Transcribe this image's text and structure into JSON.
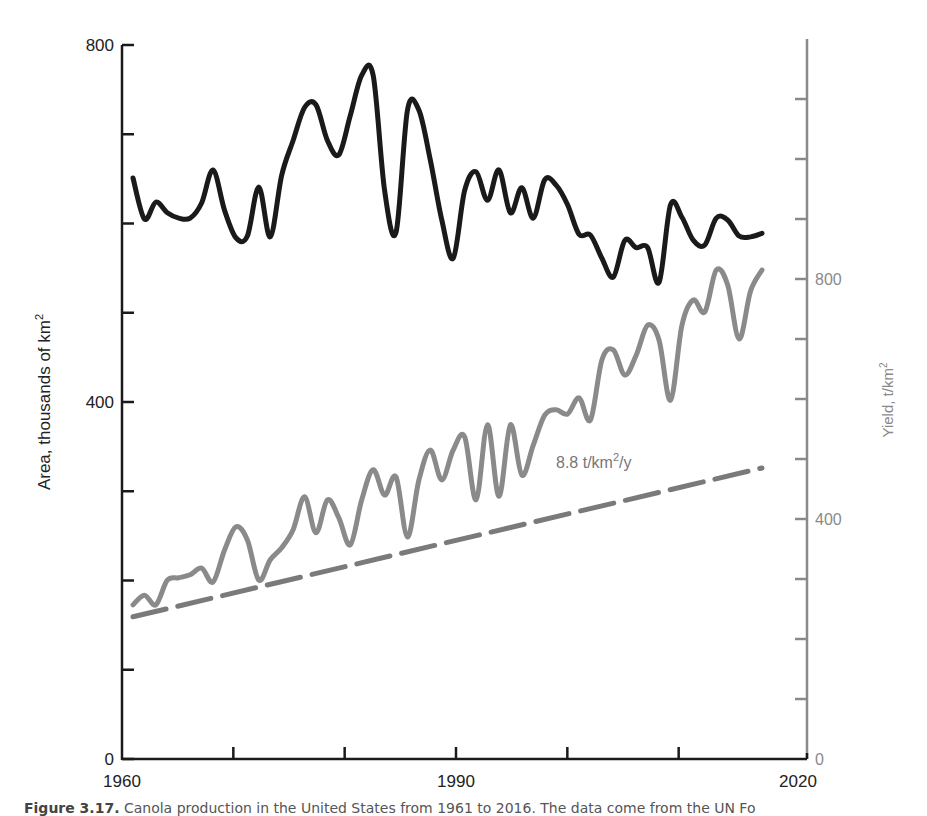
{
  "figure": {
    "caption_label": "Figure 3.17.",
    "caption_text": "Canola production in the United States from 1961 to 2016. The data come from the UN Fo"
  },
  "chart_data": {
    "type": "line",
    "title": "",
    "xlabel": "",
    "x_ticks": [
      1960,
      1970,
      1980,
      1990,
      2000,
      2010,
      2020
    ],
    "x_tick_labels": [
      "1960",
      "1990",
      "2020"
    ],
    "xlim": [
      1960,
      2020
    ],
    "y_left": {
      "label": "Area, thousands of km",
      "label_superscript": "2",
      "ylim": [
        0,
        800
      ],
      "tick_step": 100,
      "tick_labels": [
        "0",
        "400",
        "800"
      ],
      "color": "#1a1a1a"
    },
    "y_right": {
      "label": "Yield, t/km",
      "label_superscript": "2",
      "ylim": [
        0,
        1200
      ],
      "tick_step": 100,
      "tick_labels": [
        "0",
        "400",
        "800"
      ],
      "color": "#8a8a8a"
    },
    "annotation": {
      "text": "8.8 t/km",
      "superscript": "2",
      "suffix": "/y"
    },
    "x": [
      1961,
      1962,
      1963,
      1964,
      1965,
      1966,
      1967,
      1968,
      1969,
      1970,
      1971,
      1972,
      1973,
      1974,
      1975,
      1976,
      1977,
      1978,
      1979,
      1980,
      1981,
      1982,
      1983,
      1984,
      1985,
      1986,
      1987,
      1988,
      1989,
      1990,
      1991,
      1992,
      1993,
      1994,
      1995,
      1996,
      1997,
      1998,
      1999,
      2000,
      2001,
      2002,
      2003,
      2004,
      2005,
      2006,
      2007,
      2008,
      2009,
      2010,
      2011,
      2012,
      2013,
      2014,
      2015,
      2016
    ],
    "series": [
      {
        "name": "Area",
        "axis": "left",
        "color": "#1a1a1a",
        "values": [
          651,
          605,
          624,
          612,
          606,
          606,
          623,
          660,
          615,
          584,
          586,
          641,
          585,
          654,
          693,
          730,
          733,
          693,
          677,
          721,
          766,
          766,
          637,
          590,
          727,
          727,
          671,
          604,
          561,
          637,
          658,
          626,
          660,
          612,
          640,
          606,
          649,
          643,
          621,
          588,
          587,
          561,
          540,
          581,
          573,
          573,
          534,
          621,
          607,
          581,
          576,
          606,
          604,
          586,
          585,
          589
        ]
      },
      {
        "name": "Yield",
        "axis": "right",
        "color": "#8a8a8a",
        "values": [
          257,
          273,
          257,
          298,
          302,
          307,
          318,
          295,
          348,
          387,
          365,
          298,
          332,
          352,
          382,
          437,
          377,
          432,
          402,
          357,
          432,
          482,
          440,
          470,
          370,
          465,
          515,
          465,
          515,
          537,
          432,
          557,
          438,
          557,
          473,
          523,
          573,
          582,
          575,
          602,
          565,
          665,
          682,
          640,
          673,
          723,
          698,
          598,
          723,
          765,
          745,
          815,
          790,
          700,
          780,
          815
        ]
      },
      {
        "name": "Yield trend",
        "axis": "right",
        "style": "dashed",
        "color": "#7a7a7a",
        "x": [
          1961,
          2016
        ],
        "values": [
          237,
          485
        ]
      }
    ]
  }
}
